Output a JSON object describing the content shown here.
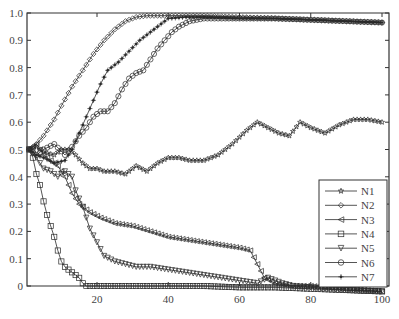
{
  "chart_data": {
    "type": "line",
    "title": "",
    "xlabel": "",
    "ylabel": "",
    "xlim": [
      0,
      100
    ],
    "ylim": [
      0,
      1.0
    ],
    "grid": false,
    "legend_position": "lower right",
    "x_ticks": [
      20,
      40,
      60,
      80,
      100
    ],
    "y_ticks": [
      0,
      0.1,
      0.2,
      0.3,
      0.4,
      0.5,
      0.6,
      0.7,
      0.8,
      0.9,
      1.0
    ],
    "y_tick_labels": [
      "0",
      "0.1",
      "0.2",
      "0.3",
      "0.4",
      "0.5",
      "0.6",
      "0.7",
      "0.8",
      "0.9",
      "1.0"
    ],
    "x_tick_labels": [
      "20",
      "40",
      "60",
      "80",
      "100"
    ],
    "series": [
      {
        "name": "N1",
        "marker": "star",
        "x": [
          1,
          3,
          5,
          8,
          10,
          12,
          14,
          16,
          18,
          20,
          22,
          25,
          28,
          31,
          34,
          37,
          40,
          43,
          46,
          50,
          54,
          58,
          62,
          65,
          68,
          71,
          74,
          77,
          80,
          84,
          88,
          92,
          96,
          100
        ],
        "y": [
          0.5,
          0.51,
          0.49,
          0.48,
          0.5,
          0.5,
          0.48,
          0.45,
          0.43,
          0.43,
          0.42,
          0.42,
          0.41,
          0.44,
          0.42,
          0.45,
          0.47,
          0.47,
          0.46,
          0.46,
          0.48,
          0.52,
          0.57,
          0.6,
          0.58,
          0.56,
          0.55,
          0.6,
          0.58,
          0.56,
          0.59,
          0.61,
          0.61,
          0.6
        ]
      },
      {
        "name": "N2",
        "marker": "diamond",
        "x": [
          1,
          3,
          5,
          8,
          10,
          13,
          16,
          19,
          22,
          25,
          28,
          31,
          34,
          37,
          40,
          45,
          50,
          60,
          70,
          80,
          90,
          100
        ],
        "y": [
          0.5,
          0.52,
          0.55,
          0.61,
          0.66,
          0.73,
          0.79,
          0.85,
          0.9,
          0.94,
          0.97,
          0.985,
          0.99,
          0.99,
          0.99,
          0.99,
          0.99,
          0.985,
          0.98,
          0.975,
          0.97,
          0.965
        ]
      },
      {
        "name": "N3",
        "marker": "triangle-left",
        "x": [
          1,
          3,
          5,
          7,
          9,
          11,
          13,
          15,
          18,
          21,
          25,
          30,
          35,
          40,
          45,
          50,
          55,
          60,
          63,
          65,
          67,
          70,
          75,
          80,
          90,
          100
        ],
        "y": [
          0.5,
          0.52,
          0.48,
          0.46,
          0.44,
          0.4,
          0.34,
          0.3,
          0.27,
          0.25,
          0.23,
          0.22,
          0.2,
          0.18,
          0.17,
          0.16,
          0.15,
          0.14,
          0.13,
          0.08,
          0.03,
          0.01,
          0.0,
          0.0,
          -0.01,
          -0.02
        ]
      },
      {
        "name": "N4",
        "marker": "square",
        "x": [
          1,
          2,
          3,
          4,
          5,
          6,
          7,
          8,
          9,
          10,
          11,
          12,
          13,
          14,
          15,
          16,
          17,
          20,
          30,
          40,
          50,
          60,
          70,
          80,
          90,
          100
        ],
        "y": [
          0.5,
          0.47,
          0.41,
          0.37,
          0.31,
          0.26,
          0.22,
          0.18,
          0.13,
          0.09,
          0.07,
          0.06,
          0.05,
          0.04,
          0.03,
          0.01,
          0.0,
          0.0,
          0.0,
          0.0,
          0.0,
          -0.005,
          -0.005,
          -0.01,
          -0.015,
          -0.02
        ]
      },
      {
        "name": "N5",
        "marker": "triangle-down",
        "x": [
          1,
          3,
          5,
          7,
          9,
          11,
          13,
          14,
          16,
          18,
          20,
          22,
          25,
          28,
          31,
          35,
          40,
          45,
          50,
          55,
          60,
          65,
          68,
          70,
          72,
          75,
          80,
          90,
          100
        ],
        "y": [
          0.5,
          0.47,
          0.43,
          0.42,
          0.4,
          0.42,
          0.4,
          0.35,
          0.29,
          0.21,
          0.16,
          0.11,
          0.09,
          0.08,
          0.07,
          0.07,
          0.06,
          0.05,
          0.04,
          0.03,
          0.02,
          0.01,
          0.03,
          0.02,
          0.01,
          0.0,
          -0.005,
          -0.015,
          -0.02
        ]
      },
      {
        "name": "N6",
        "marker": "circle",
        "x": [
          1,
          3,
          5,
          8,
          11,
          13,
          15,
          17,
          19,
          21,
          23,
          25,
          27,
          29,
          31,
          33,
          35,
          37,
          39,
          41,
          43,
          46,
          50,
          60,
          70,
          80,
          90,
          100
        ],
        "y": [
          0.5,
          0.48,
          0.5,
          0.52,
          0.48,
          0.51,
          0.55,
          0.58,
          0.62,
          0.64,
          0.64,
          0.67,
          0.72,
          0.76,
          0.78,
          0.79,
          0.83,
          0.87,
          0.9,
          0.93,
          0.95,
          0.97,
          0.98,
          0.98,
          0.98,
          0.975,
          0.97,
          0.965
        ]
      },
      {
        "name": "N7",
        "marker": "asterisk",
        "x": [
          1,
          3,
          5,
          8,
          11,
          13,
          15,
          17,
          19,
          21,
          23,
          26,
          29,
          32,
          35,
          38,
          40,
          45,
          50,
          60,
          70,
          80,
          90,
          100
        ],
        "y": [
          0.5,
          0.48,
          0.47,
          0.45,
          0.46,
          0.5,
          0.56,
          0.62,
          0.68,
          0.74,
          0.79,
          0.82,
          0.86,
          0.9,
          0.93,
          0.96,
          0.98,
          0.985,
          0.985,
          0.98,
          0.98,
          0.975,
          0.97,
          0.965
        ]
      }
    ]
  },
  "colors": {
    "line": "#2a2a2a",
    "axis": "#333333",
    "text": "#444444",
    "background": "#ffffff"
  }
}
